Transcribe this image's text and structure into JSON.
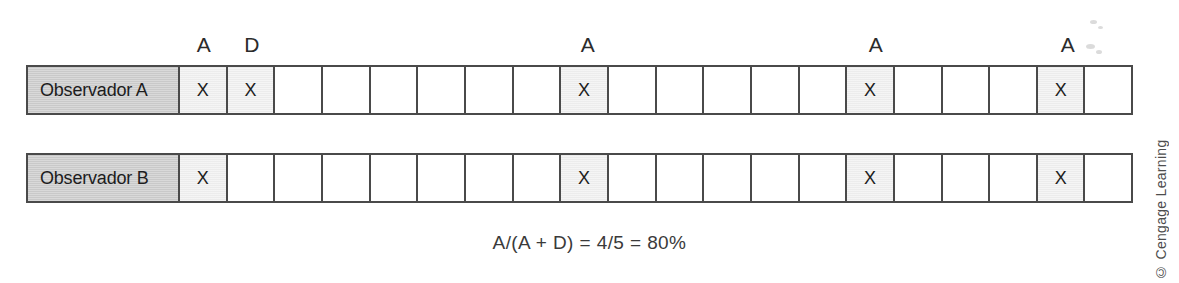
{
  "figure": {
    "title_letters_legend": [
      "A",
      "D"
    ],
    "grid_cell_count": 20,
    "headers": [
      {
        "cell_index": 1,
        "label": "A"
      },
      {
        "cell_index": 2,
        "label": "D"
      },
      {
        "cell_index": 9,
        "label": "A"
      },
      {
        "cell_index": 15,
        "label": "A"
      },
      {
        "cell_index": 19,
        "label": "A"
      }
    ],
    "rows": [
      {
        "label": "Observador A",
        "marks": [
          "X",
          "X",
          "",
          "",
          "",
          "",
          "",
          "",
          "X",
          "",
          "",
          "",
          "",
          "",
          "X",
          "",
          "",
          "",
          "X",
          ""
        ]
      },
      {
        "label": "Observador B",
        "marks": [
          "X",
          "",
          "",
          "",
          "",
          "",
          "",
          "",
          "X",
          "",
          "",
          "",
          "",
          "",
          "X",
          "",
          "",
          "",
          "X",
          ""
        ]
      }
    ],
    "formula": "A/(A + D) = 4/5 = 80%",
    "credit": "© Cengage Learning",
    "colors": {
      "label_fill": "#c9c9c9",
      "mark_fill": "#ececec",
      "border": "#4a4a4a",
      "text": "#1d1d1d",
      "background": "#ffffff"
    }
  }
}
